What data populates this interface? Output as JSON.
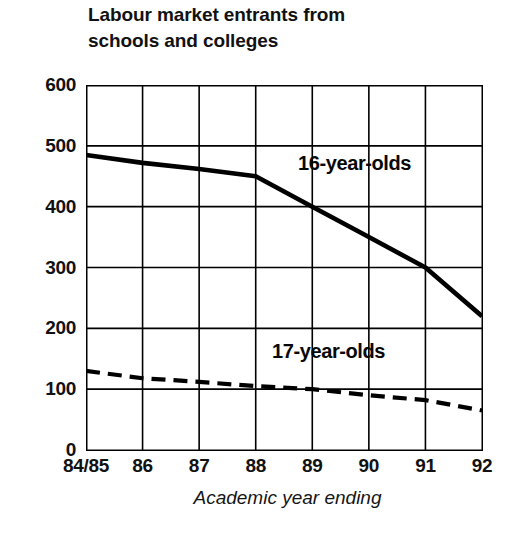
{
  "chart_data": {
    "type": "line",
    "title": "Labour market entrants from schools and colleges",
    "title_line1": "Labour market entrants from",
    "title_line2": "schools and colleges",
    "xlabel": "Academic year ending",
    "ylabel": "",
    "categories": [
      "84/85",
      "86",
      "87",
      "88",
      "89",
      "90",
      "91",
      "92"
    ],
    "x_tick_labels": [
      "84/85",
      "86",
      "87",
      "88",
      "89",
      "90",
      "91",
      "92"
    ],
    "y_tick_labels": [
      "0",
      "100",
      "200",
      "300",
      "400",
      "500",
      "600"
    ],
    "y_ticks": [
      0,
      100,
      200,
      300,
      400,
      500,
      600
    ],
    "ylim": [
      0,
      600
    ],
    "grid": true,
    "legend_position": "inline-annotation",
    "series": [
      {
        "name": "16-year-olds",
        "label": "16-year-olds",
        "style": "solid",
        "color": "#000000",
        "values": [
          485,
          472,
          462,
          450,
          400,
          350,
          300,
          220
        ]
      },
      {
        "name": "17-year-olds",
        "label": "17-year-olds",
        "style": "dashed",
        "color": "#000000",
        "values": [
          130,
          118,
          112,
          105,
          100,
          90,
          82,
          65
        ]
      }
    ],
    "source_note": ""
  }
}
